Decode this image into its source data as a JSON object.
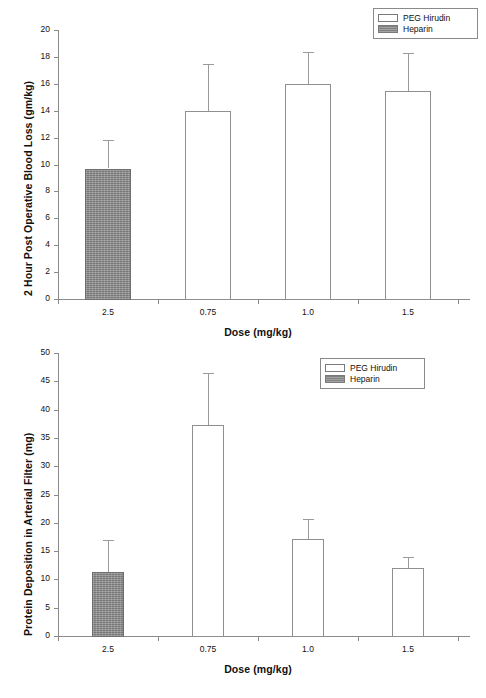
{
  "figure": {
    "panels": [
      "chart-top",
      "chart-bottom"
    ]
  },
  "chart_data": [
    {
      "type": "bar",
      "title": "",
      "xlabel": "Dose (mg/kg)",
      "ylabel": "2 Hour Post Operative Blood Loss (gm/kg)",
      "categories": [
        "2.5",
        "0.75",
        "1.0",
        "1.5"
      ],
      "ylim": [
        0,
        20
      ],
      "yticks": [
        0,
        2,
        4,
        6,
        8,
        10,
        12,
        14,
        16,
        18,
        20
      ],
      "ytick_labels": [
        "0",
        "2",
        "4",
        "6",
        "8",
        "10",
        "12",
        "14",
        "16",
        "18",
        "20"
      ],
      "grid": false,
      "legend_position": "top-right",
      "legend": [
        {
          "label": "PEG Hirudin",
          "style": "open"
        },
        {
          "label": "Heparin",
          "style": "filled"
        }
      ],
      "series": [
        {
          "name": "Heparin",
          "style": "filled",
          "points": [
            {
              "category": "2.5",
              "value": 9.7,
              "error_upper": 11.8
            }
          ]
        },
        {
          "name": "PEG Hirudin",
          "style": "open",
          "points": [
            {
              "category": "0.75",
              "value": 14.0,
              "error_upper": 17.5
            },
            {
              "category": "1.0",
              "value": 16.0,
              "error_upper": 18.4
            },
            {
              "category": "1.5",
              "value": 15.5,
              "error_upper": 18.3
            }
          ]
        }
      ]
    },
    {
      "type": "bar",
      "title": "",
      "xlabel": "Dose (mg/kg)",
      "ylabel": "Protein Deposition in Arterial Filter (mg)",
      "categories": [
        "2.5",
        "0.75",
        "1.0",
        "1.5"
      ],
      "ylim": [
        0,
        50
      ],
      "yticks": [
        0,
        5,
        10,
        15,
        20,
        25,
        30,
        35,
        40,
        45,
        50
      ],
      "ytick_labels": [
        "0",
        "5",
        "10",
        "15",
        "20",
        "25",
        "30",
        "35",
        "40",
        "45",
        "50"
      ],
      "grid": false,
      "legend_position": "top-right",
      "legend": [
        {
          "label": "PEG Hirudin",
          "style": "open"
        },
        {
          "label": "Heparin",
          "style": "filled"
        }
      ],
      "series": [
        {
          "name": "Heparin",
          "style": "filled",
          "points": [
            {
              "category": "2.5",
              "value": 11.3,
              "error_upper": 16.9
            }
          ]
        },
        {
          "name": "PEG Hirudin",
          "style": "open",
          "points": [
            {
              "category": "0.75",
              "value": 37.3,
              "error_upper": 46.5
            },
            {
              "category": "1.0",
              "value": 17.2,
              "error_upper": 20.7
            },
            {
              "category": "1.5",
              "value": 12.0,
              "error_upper": 14.0
            }
          ]
        }
      ]
    }
  ],
  "colors": {
    "bar_open_fill": "#ffffff",
    "bar_filled_fill": "#8f8f8f",
    "bar_stroke": "#8f8f8f",
    "axis": "#8a8a8a",
    "text": "#111111",
    "background": "#ffffff"
  }
}
